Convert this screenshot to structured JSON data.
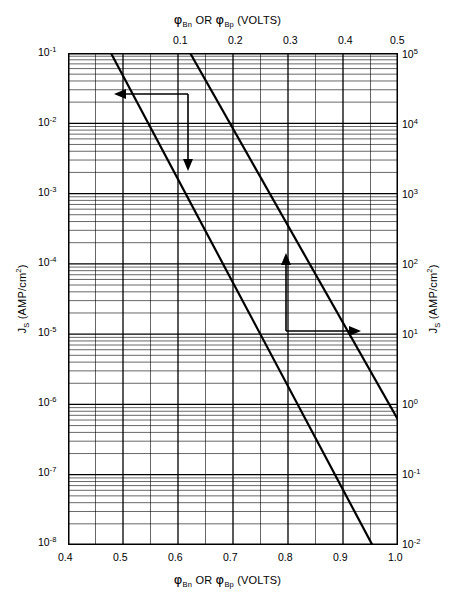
{
  "figure": {
    "background_color": "#ffffff",
    "ink_color": "#000000"
  },
  "top_axis": {
    "title_prefix": "φ",
    "title": "φBn OR φBp (VOLTS)",
    "title_parts": {
      "phi1": "φ",
      "sub1": "Bn",
      "conj": "OR",
      "phi2": "φ",
      "sub2": "Bp",
      "units": "(VOLTS)"
    },
    "tick_labels": [
      "0.1",
      "0.2",
      "0.3",
      "0.4",
      "0.5"
    ],
    "range": [
      0.0,
      0.5
    ]
  },
  "bottom_axis": {
    "title_parts": {
      "phi1": "φ",
      "sub1": "Bn",
      "conj": "OR",
      "phi2": "φ",
      "sub2": "Bp",
      "units": "(VOLTS)"
    },
    "tick_labels": [
      "0.4",
      "0.5",
      "0.6",
      "0.7",
      "0.8",
      "0.9",
      "1.0"
    ],
    "range": [
      0.4,
      1.0
    ]
  },
  "left_axis": {
    "title_parts": {
      "symbol": "J",
      "sub": "S",
      "units": "(AMP/cm",
      "units_sup": "2",
      "units_end": ")"
    },
    "base": "10",
    "exponents": [
      "-1",
      "-2",
      "-3",
      "-4",
      "-5",
      "-6",
      "-7",
      "-8"
    ],
    "range_exp": [
      -8,
      -1
    ]
  },
  "right_axis": {
    "title_parts": {
      "symbol": "J",
      "sub": "S",
      "units": "(AMP/cm",
      "units_sup": "2",
      "units_end": ")"
    },
    "base": "10",
    "exponents": [
      "5",
      "4",
      "3",
      "2",
      "1",
      "0",
      "-1",
      "-2"
    ],
    "range_exp": [
      -2,
      5
    ]
  },
  "annotation": {
    "line1_label": "T=",
    "line1_value": "300° K",
    "line1": "T= 300° K",
    "line2_symbol": "A*",
    "line2_eq": "=",
    "line2_value": "120 AMP/cm",
    "line2_sup1": "2",
    "line2_mid": "/°K",
    "line2_sup2": "2",
    "line2": "A*=120 AMP/cm2/°K2"
  },
  "arrows": {
    "left_down_group_name": "left-bottom-axis-pointer",
    "up_right_group_name": "top-right-axis-pointer",
    "left_arrow": "←",
    "down_arrow": "↓",
    "up_arrow": "↑",
    "right_arrow": "→"
  },
  "chart_data": {
    "type": "line",
    "title": "",
    "xlabel": "φBn OR φBp (VOLTS)",
    "ylabel": "JS (AMP/cm2)",
    "x_top_label": "φBn OR φBp (VOLTS)",
    "y_right_label": "JS (AMP/cm2)",
    "xscale": "linear",
    "yscale": "log",
    "xlim": [
      0.4,
      1.0
    ],
    "ylim": [
      1e-08,
      0.1
    ],
    "xlim_top": [
      0.0,
      0.5
    ],
    "ylim_right": [
      0.01,
      100000
    ],
    "grid": true,
    "grid_minor": true,
    "x_major_ticks": [
      0.4,
      0.5,
      0.6,
      0.7,
      0.8,
      0.9,
      1.0
    ],
    "x_minor_step": 0.05,
    "x_top_major_ticks": [
      0.0,
      0.1,
      0.2,
      0.3,
      0.4,
      0.5
    ],
    "y_major_ticks": [
      1e-08,
      1e-07,
      1e-06,
      1e-05,
      0.0001,
      0.001,
      0.01,
      0.1
    ],
    "legend_position": "none",
    "annotations": [
      {
        "text": "T= 300° K",
        "x": 0.62,
        "y": 0.03
      },
      {
        "text": "A*=120 AMP/cm2/°K2",
        "x": 0.62,
        "y": 0.015
      }
    ],
    "series": [
      {
        "name": "Js vs barrier height (upper scale)",
        "comment": "Line plotted against TOP x-axis (0-0.5 V) and LEFT y-axis; Js = A*T^2 exp(-q*phi/kT)",
        "x_axis": "top",
        "y_axis": "left",
        "x": [
          0.065,
          0.09,
          0.12,
          0.15,
          0.18,
          0.21,
          0.245
        ],
        "y": [
          0.1,
          0.0358,
          0.0105,
          0.00308,
          0.000904,
          0.000265,
          6.6e-05
        ],
        "endpoints_top_x": 0.065,
        "endpoints_bottom_x": 0.5
      },
      {
        "name": "Js vs barrier height (lower scale)",
        "comment": "Parallel line, same slope, offset one major x division",
        "x_axis": "top",
        "y_axis": "left",
        "x": [
          0.185,
          0.22,
          0.26,
          0.3,
          0.34,
          0.38,
          0.42
        ],
        "y": [
          0.1,
          0.0276,
          0.00595,
          0.00128,
          0.000277,
          5.96e-05,
          1.28e-05
        ],
        "endpoints_top_x": 0.185,
        "endpoints_bottom_x": 0.62
      }
    ],
    "slope_decades_per_volt": -16.9,
    "equation": "Js = A* T^2 exp(-q phiB / kT)"
  }
}
